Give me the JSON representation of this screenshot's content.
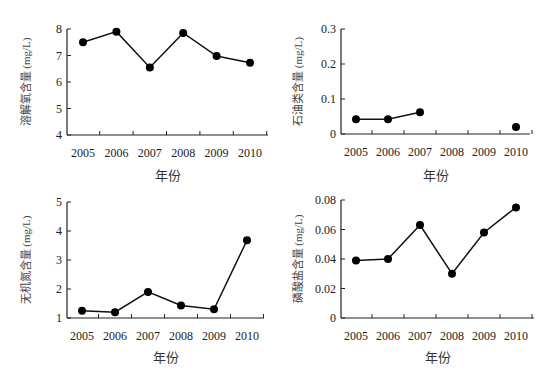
{
  "chart_data": [
    {
      "type": "line",
      "title": "",
      "xlabel": "年份",
      "ylabel": "溶解氧含量 (mg/L)",
      "categories": [
        "2005",
        "2006",
        "2007",
        "2008",
        "2009",
        "2010"
      ],
      "values": [
        7.5,
        7.9,
        6.55,
        7.85,
        6.98,
        6.73
      ],
      "ylim": [
        4,
        8
      ],
      "yticks": [
        "4",
        "5",
        "6",
        "7",
        "8"
      ],
      "grid": false
    },
    {
      "type": "line",
      "title": "",
      "xlabel": "年份",
      "ylabel": "石油类含量 (mg/L)",
      "categories": [
        "2005",
        "2006",
        "2007",
        "2008",
        "2009",
        "2010"
      ],
      "values": [
        0.042,
        0.042,
        0.062,
        null,
        null,
        0.02
      ],
      "ylim": [
        0,
        0.3
      ],
      "yticks": [
        "0",
        "0.1",
        "0.2",
        "0.3"
      ],
      "grid": false
    },
    {
      "type": "line",
      "title": "",
      "xlabel": "年份",
      "ylabel": "无机氮含量 (mg/L)",
      "categories": [
        "2005",
        "2006",
        "2007",
        "2008",
        "2009",
        "2010"
      ],
      "values": [
        1.25,
        1.2,
        1.9,
        1.43,
        1.3,
        3.68
      ],
      "ylim": [
        1,
        5
      ],
      "yticks": [
        "1",
        "2",
        "3",
        "4",
        "5"
      ],
      "grid": false
    },
    {
      "type": "line",
      "title": "",
      "xlabel": "年份",
      "ylabel": "磷酸盐含量 (mg/L)",
      "categories": [
        "2005",
        "2006",
        "2007",
        "2008",
        "2009",
        "2010"
      ],
      "values": [
        0.039,
        0.04,
        0.063,
        0.03,
        0.058,
        0.075
      ],
      "ylim": [
        0,
        0.08
      ],
      "yticks": [
        "0",
        "0.02",
        "0.04",
        "0.06",
        "0.08"
      ],
      "grid": false
    }
  ]
}
